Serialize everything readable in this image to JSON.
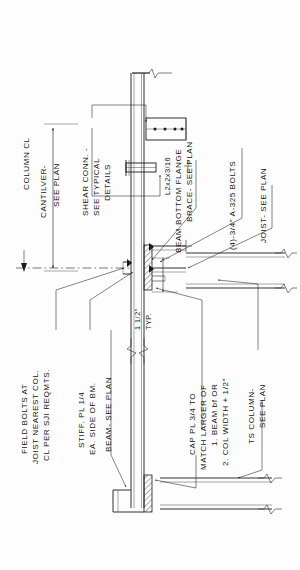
{
  "drawing": {
    "type": "structural-steel-connection-detail",
    "orientation": "rotated-90-ccw",
    "background_color": "#fdfdfd",
    "line_color": "#1a1a1a",
    "annotations": {
      "column_cl": "COLUMN CL",
      "cantilever_l1": "CANTILVER-",
      "cantilever_l2": "SEE PLAN",
      "shear_conn_l1": "SHEAR CONN. -",
      "shear_conn_l2": "SEE TYPICAL",
      "shear_conn_l3": "DETAILS",
      "field_bolts_l1": "FIELD BOLTS AT",
      "field_bolts_l2": "JOIST NEAREST COL.",
      "field_bolts_l3": "CL PER SJI REQMTS.",
      "stiff_pl_l1": "STIFF. PL 1/4",
      "stiff_pl_l2": "EA. SIDE OF BM.",
      "beam_see_plan": "BEAM- SEE PLAN",
      "angle_brace_l1": "L2x2x3/16",
      "angle_brace_l2": "BEAM BOTTOM FLANGE",
      "angle_brace_l3": "BRACE- SEE PLAN",
      "bolts_note": "(4)-3/4\" A-325 BOLTS",
      "joist_see_plan": "JOIST- SEE PLAN",
      "cap_pl_l1": "CAP PL 3/4 TO",
      "cap_pl_l2": "MATCH LARGER OF",
      "cap_pl_l3": "1. BEAM bf OR",
      "cap_pl_l4": "2. COL WIDTH + 1/2\"",
      "ts_column_l1": "TS COLUMN-",
      "ts_column_l2": "SEE PLAN",
      "dim_typ_l1": "1 1/2\"",
      "dim_typ_l2": "TYP."
    }
  }
}
